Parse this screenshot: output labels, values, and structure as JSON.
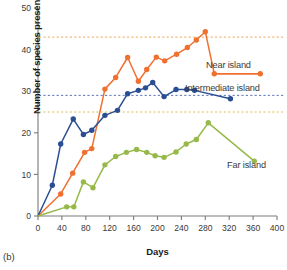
{
  "figure": {
    "panel_label": "(b)",
    "axis_label_x": "Days",
    "axis_label_y": "Number of species present"
  },
  "labels": {
    "near": "Near island",
    "intermediate": "Intermediate island",
    "far": "Far island"
  },
  "colors": {
    "near": "#F07030",
    "intermediate": "#2A4E92",
    "far": "#97B94A",
    "axis": "#7a7a7a",
    "text": "#3a3a3a"
  },
  "chart_data": {
    "type": "line",
    "title": "",
    "xlabel": "Days",
    "ylabel": "Number of species present",
    "xlim": [
      0,
      400
    ],
    "ylim": [
      0,
      50
    ],
    "xticks": [
      0,
      40,
      80,
      120,
      160,
      200,
      240,
      280,
      320,
      360,
      400
    ],
    "yticks": [
      0,
      10,
      20,
      30,
      40,
      50
    ],
    "grid": false,
    "legend_position": "inline-right",
    "markers": true,
    "annotations": [
      {
        "text": "Near island",
        "x": 330,
        "y": 37
      },
      {
        "text": "Intermediate island",
        "x": 255,
        "y": 32
      },
      {
        "text": "Far island",
        "x": 345,
        "y": 16
      }
    ],
    "reference_lines": [
      {
        "label": "Near island asymptote",
        "y": 43,
        "color": "#F0A85A",
        "style": "dashed"
      },
      {
        "label": "Intermediate island asymptote",
        "y": 29,
        "color": "#5B73B8",
        "style": "dashed"
      },
      {
        "label": "Far island asymptote",
        "y": 25,
        "color": "#D8C25A",
        "style": "dashed"
      }
    ],
    "series": [
      {
        "name": "Near island",
        "color": "#F07030",
        "points": [
          {
            "x": 0,
            "y": 0
          },
          {
            "x": 38,
            "y": 5.3
          },
          {
            "x": 58,
            "y": 10.3
          },
          {
            "x": 78,
            "y": 15.3
          },
          {
            "x": 90,
            "y": 16.2
          },
          {
            "x": 112,
            "y": 30.5
          },
          {
            "x": 130,
            "y": 33.3
          },
          {
            "x": 150,
            "y": 38.1
          },
          {
            "x": 168,
            "y": 32.4
          },
          {
            "x": 182,
            "y": 35.2
          },
          {
            "x": 198,
            "y": 38.2
          },
          {
            "x": 212,
            "y": 37.3
          },
          {
            "x": 232,
            "y": 38.9
          },
          {
            "x": 250,
            "y": 40.5
          },
          {
            "x": 265,
            "y": 42.3
          },
          {
            "x": 280,
            "y": 44.3
          },
          {
            "x": 295,
            "y": 34.2
          },
          {
            "x": 372,
            "y": 34.2
          }
        ]
      },
      {
        "name": "Intermediate island",
        "color": "#2A4E92",
        "points": [
          {
            "x": 0,
            "y": 0
          },
          {
            "x": 24,
            "y": 7.4
          },
          {
            "x": 38,
            "y": 17.3
          },
          {
            "x": 59,
            "y": 23.3
          },
          {
            "x": 76,
            "y": 19.6
          },
          {
            "x": 90,
            "y": 20.6
          },
          {
            "x": 112,
            "y": 24.2
          },
          {
            "x": 133,
            "y": 25.4
          },
          {
            "x": 150,
            "y": 29.4
          },
          {
            "x": 168,
            "y": 30.2
          },
          {
            "x": 180,
            "y": 30.8
          },
          {
            "x": 192,
            "y": 32.1
          },
          {
            "x": 211,
            "y": 28.7
          },
          {
            "x": 231,
            "y": 30.4
          },
          {
            "x": 249,
            "y": 30.4
          },
          {
            "x": 262,
            "y": 30.2
          },
          {
            "x": 322,
            "y": 28.2
          }
        ]
      },
      {
        "name": "Far island",
        "color": "#97B94A",
        "points": [
          {
            "x": 0,
            "y": 0
          },
          {
            "x": 48,
            "y": 2.2
          },
          {
            "x": 60,
            "y": 2.2
          },
          {
            "x": 76,
            "y": 8.2
          },
          {
            "x": 92,
            "y": 6.8
          },
          {
            "x": 112,
            "y": 12.3
          },
          {
            "x": 130,
            "y": 14.3
          },
          {
            "x": 148,
            "y": 15.3
          },
          {
            "x": 165,
            "y": 16.0
          },
          {
            "x": 182,
            "y": 15.3
          },
          {
            "x": 196,
            "y": 14.5
          },
          {
            "x": 211,
            "y": 14.1
          },
          {
            "x": 231,
            "y": 15.4
          },
          {
            "x": 248,
            "y": 17.3
          },
          {
            "x": 265,
            "y": 18.4
          },
          {
            "x": 285,
            "y": 22.4
          },
          {
            "x": 362,
            "y": 13.2
          }
        ]
      }
    ]
  }
}
